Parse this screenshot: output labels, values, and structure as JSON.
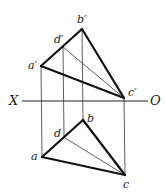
{
  "diagram": {
    "type": "orthographic-projection",
    "axis": {
      "left_label": "X",
      "right_label": "O"
    },
    "front_view": {
      "points": {
        "a": {
          "label": "a′",
          "x": 41,
          "y": 66
        },
        "b": {
          "label": "b′",
          "x": 82,
          "y": 29
        },
        "c": {
          "label": "c′",
          "x": 124,
          "y": 98
        },
        "d": {
          "label": "d′",
          "x": 63,
          "y": 47
        }
      },
      "edges": [
        [
          "a",
          "b"
        ],
        [
          "b",
          "c"
        ],
        [
          "c",
          "a"
        ]
      ],
      "thin_lines": [
        [
          "d",
          "c"
        ]
      ]
    },
    "top_view": {
      "points": {
        "a": {
          "label": "a",
          "x": 42,
          "y": 157
        },
        "b": {
          "label": "b",
          "x": 83,
          "y": 120
        },
        "c": {
          "label": "c",
          "x": 125,
          "y": 175
        },
        "d": {
          "label": "d",
          "x": 65,
          "y": 137
        }
      },
      "edges": [
        [
          "a",
          "b"
        ],
        [
          "b",
          "c"
        ],
        [
          "c",
          "a"
        ]
      ],
      "thin_lines": [
        [
          "d",
          "c"
        ]
      ]
    },
    "projection_lines": [
      "a",
      "d",
      "b",
      "c"
    ]
  }
}
